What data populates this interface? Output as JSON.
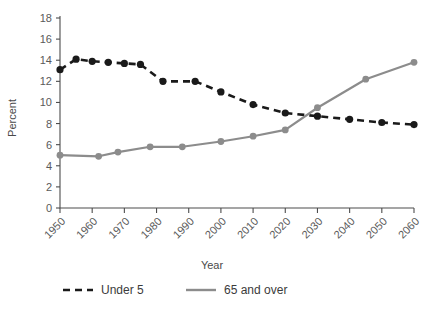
{
  "chart_data": {
    "type": "line",
    "title": "",
    "xlabel": "Year",
    "ylabel": "Percent",
    "xlim": [
      1950,
      2060
    ],
    "ylim": [
      0,
      18
    ],
    "ytick_step": 2,
    "grid": false,
    "legend_position": "bottom",
    "xticks": [
      "1950",
      "1960",
      "1970",
      "1980",
      "1990",
      "2000",
      "2010",
      "2020",
      "2030",
      "2040",
      "2050",
      "2060"
    ],
    "yticks": [
      "0",
      "2",
      "4",
      "6",
      "8",
      "10",
      "12",
      "14",
      "16",
      "18"
    ],
    "series": [
      {
        "name": "Under 5",
        "color": "#1a1a1a",
        "style": "dashed",
        "marker": "circle",
        "x": [
          1950,
          1955,
          1960,
          1965,
          1970,
          1975,
          1982,
          1992,
          2000,
          2010,
          2020,
          2030,
          2040,
          2050,
          2060
        ],
        "values": [
          13.1,
          14.1,
          13.9,
          13.8,
          13.7,
          13.6,
          12.0,
          12.0,
          11.0,
          9.8,
          9.0,
          8.7,
          8.4,
          8.1,
          7.9
        ]
      },
      {
        "name": "65 and over",
        "color": "#8c8c8c",
        "style": "solid",
        "marker": "circle",
        "x": [
          1950,
          1962,
          1968,
          1978,
          1988,
          2000,
          2010,
          2020,
          2030,
          2045,
          2060
        ],
        "values": [
          5.0,
          4.9,
          5.3,
          5.8,
          5.8,
          6.3,
          6.8,
          7.4,
          9.5,
          12.2,
          13.8
        ]
      }
    ],
    "crossover": {
      "year": 2030,
      "value": 9.2
    }
  },
  "legend": {
    "items": [
      {
        "label": "Under 5"
      },
      {
        "label": "65 and over"
      }
    ]
  }
}
